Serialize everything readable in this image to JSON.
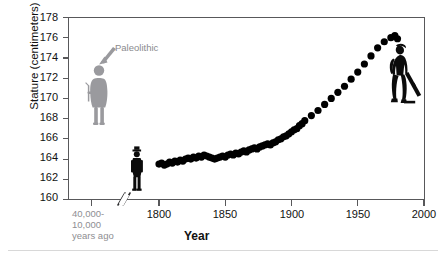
{
  "chart_data": {
    "type": "scatter",
    "title": "",
    "xlabel": "Year",
    "ylabel": "Stature (centimeters)",
    "ylim": [
      160,
      178
    ],
    "xlim": [
      1780,
      2000
    ],
    "grid": false,
    "legend": null,
    "yticks": [
      178,
      176,
      174,
      172,
      170,
      168,
      166,
      164,
      162,
      160
    ],
    "xticks": [
      "40,000-\n10,000\nyears ago",
      "1800",
      "1850",
      "1900",
      "1950",
      "2000"
    ],
    "axis_break": true,
    "annotations": [
      {
        "text": "Paleolithic",
        "x": 40000,
        "y": 174,
        "note": "gray arrow pointing down-left to gray human figure at ~172.5 cm"
      }
    ],
    "paleolithic_stature": 172.5,
    "x": [
      1800,
      1802,
      1804,
      1806,
      1808,
      1810,
      1812,
      1814,
      1816,
      1818,
      1820,
      1822,
      1824,
      1826,
      1828,
      1830,
      1832,
      1834,
      1836,
      1838,
      1840,
      1842,
      1844,
      1846,
      1848,
      1850,
      1852,
      1854,
      1856,
      1858,
      1860,
      1862,
      1864,
      1866,
      1868,
      1870,
      1872,
      1874,
      1876,
      1878,
      1880,
      1882,
      1884,
      1886,
      1888,
      1890,
      1892,
      1894,
      1896,
      1898,
      1900,
      1902,
      1904,
      1906,
      1908,
      1910,
      1915,
      1920,
      1925,
      1930,
      1935,
      1940,
      1945,
      1950,
      1955,
      1960,
      1965,
      1970,
      1975,
      1978,
      1980
    ],
    "y": [
      163.5,
      163.6,
      163.4,
      163.5,
      163.7,
      163.6,
      163.8,
      163.7,
      163.9,
      163.8,
      164.0,
      164.1,
      164.0,
      164.2,
      164.1,
      164.3,
      164.2,
      164.4,
      164.3,
      164.2,
      164.1,
      164.0,
      164.1,
      164.2,
      164.3,
      164.2,
      164.4,
      164.5,
      164.4,
      164.6,
      164.5,
      164.7,
      164.8,
      164.7,
      164.9,
      165.0,
      165.1,
      165.0,
      165.2,
      165.3,
      165.4,
      165.5,
      165.4,
      165.6,
      165.7,
      165.9,
      166.0,
      166.2,
      166.3,
      166.5,
      166.7,
      166.9,
      167.0,
      167.3,
      167.5,
      167.8,
      168.3,
      168.8,
      169.4,
      170.0,
      170.6,
      171.2,
      171.9,
      172.6,
      173.4,
      174.2,
      175.0,
      175.6,
      176.0,
      176.2,
      175.9
    ],
    "series_color": "#000000"
  },
  "axes": {
    "y_title": "Stature (centimeters)",
    "x_title": "Year",
    "y_ticks": [
      "178",
      "176",
      "174",
      "172",
      "170",
      "168",
      "166",
      "164",
      "162",
      "160"
    ],
    "x_ticks": [
      "1800",
      "1850",
      "1900",
      "1950",
      "2000"
    ],
    "x_tick_paleo_line1": "40,000-",
    "x_tick_paleo_line2": "10,000",
    "x_tick_paleo_line3": "years ago"
  },
  "figures": {
    "paleolithic_label": "Paleolithic",
    "paleolithic_figure_name": "paleolithic-human-silhouette",
    "historic_figure_name": "nineteenth-century-human-silhouette",
    "modern_figure_name": "modern-skateboarder-silhouette"
  },
  "colors": {
    "data_points": "#000000",
    "paleolithic_figure": "#9a9a9e",
    "annotation_text": "#8a8a8e",
    "axis": "#58585a",
    "tick_text": "#111111",
    "bottom_rule": "#d8d8d8"
  }
}
